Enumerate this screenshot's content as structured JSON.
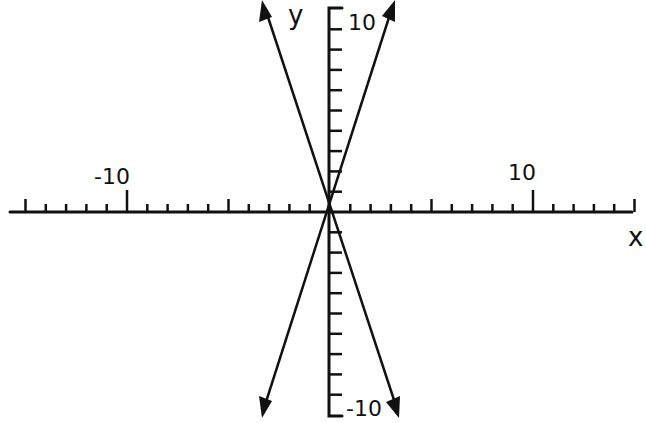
{
  "chart_data": {
    "type": "line",
    "title": "",
    "xlabel": "x",
    "ylabel": "y",
    "xlim": [
      -15.8,
      15
    ],
    "ylim": [
      -10,
      10
    ],
    "x_tick_labels": [
      "-10",
      "10"
    ],
    "y_tick_labels": [
      "10",
      "-10"
    ],
    "x_minor_tick_step": 1,
    "x_major_tick_step": 5,
    "y_tick_step": 1,
    "grid": false,
    "series": [
      {
        "name": "y = 3x",
        "x": [
          -3.3,
          0,
          3.1
        ],
        "y": [
          -9.9,
          0,
          10.3
        ],
        "arrows": "both"
      },
      {
        "name": "y = -3x",
        "x": [
          -3.35,
          0,
          3.3
        ],
        "y": [
          10.2,
          0,
          -9.9
        ],
        "arrows": "both"
      }
    ]
  },
  "labels": {
    "x_axis": "x",
    "y_axis": "y",
    "x_neg10": "-10",
    "x_pos10": "10",
    "y_pos10": "10",
    "y_neg10": "-10"
  }
}
